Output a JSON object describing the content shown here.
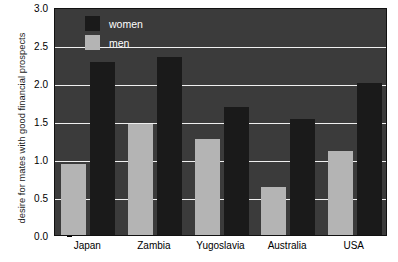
{
  "chart_data": {
    "type": "bar",
    "title": "",
    "subtitle": "",
    "xlabel": "",
    "ylabel": "desire for mates with good financial prospects",
    "categories": [
      "Japan",
      "Zambia",
      "Yugoslavia",
      "Australia",
      "USA"
    ],
    "series": [
      {
        "name": "men",
        "color": "#b4b4b4",
        "values": [
          0.93,
          1.46,
          1.26,
          0.63,
          1.1
        ]
      },
      {
        "name": "women",
        "color": "#1a1a1a",
        "values": [
          2.28,
          2.34,
          1.68,
          1.53,
          2.0
        ]
      }
    ],
    "ylim": [
      0.0,
      3.0
    ],
    "yticks": [
      "0.0",
      "0.5",
      "1.0",
      "1.5",
      "2.0",
      "2.5",
      "3.0"
    ],
    "ytick_values": [
      0.0,
      0.5,
      1.0,
      1.5,
      2.0,
      2.5,
      3.0
    ],
    "grid": true,
    "gridline_color": "#efefef",
    "plot_background": "#3b3b3b",
    "figure_background": "#ffffff",
    "legend_position": "upper left",
    "legend_entries": [
      {
        "label": "women",
        "color": "#1a1a1a"
      },
      {
        "label": "men",
        "color": "#b4b4b4"
      }
    ]
  }
}
